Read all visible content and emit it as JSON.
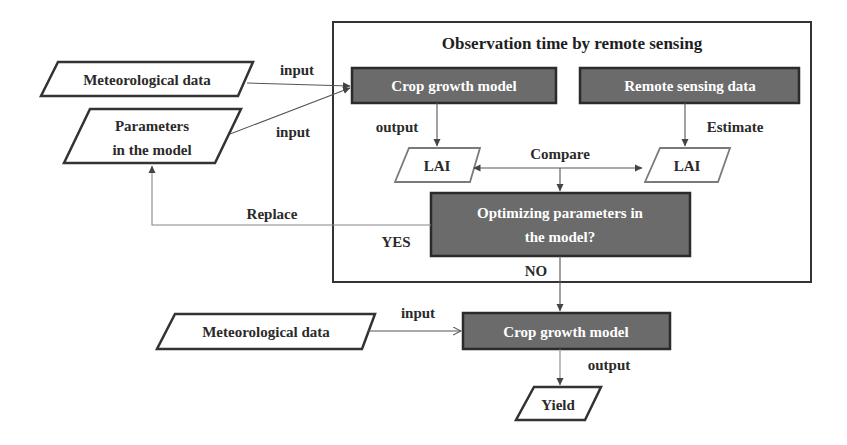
{
  "frame": {
    "title": "Observation time by remote sensing"
  },
  "inputs": {
    "meteorological_top": "Meteorological data",
    "parameters_line1": "Parameters",
    "parameters_line2": "in the model",
    "meteorological_bottom": "Meteorological data"
  },
  "process": {
    "crop_model_top": "Crop growth model",
    "remote_sensing": "Remote sensing data",
    "optimizing_line1": "Optimizing  parameters in",
    "optimizing_line2": "the model?",
    "crop_model_bottom": "Crop growth model"
  },
  "data_nodes": {
    "lai_left": "LAI",
    "lai_right": "LAI",
    "yield": "Yield"
  },
  "edge_labels": {
    "input_met_top": "input",
    "input_params": "input",
    "output_top": "output",
    "estimate": "Estimate",
    "compare": "Compare",
    "replace": "Replace",
    "yes": "YES",
    "no": "NO",
    "input_met_bottom": "input",
    "output_bottom": "output"
  },
  "colors": {
    "process_fill": "#6b6b6b",
    "process_text": "#ffffff",
    "stroke": "#333333",
    "background": "#ffffff"
  }
}
